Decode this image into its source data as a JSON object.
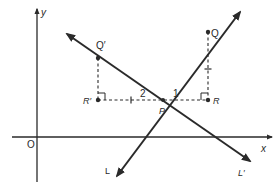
{
  "diagram": {
    "type": "coordinate-geometry",
    "colors": {
      "ink": "#2a2a2a",
      "background": "#ffffff"
    },
    "axes": {
      "x_label": "x",
      "y_label": "y",
      "origin_label": "O"
    },
    "points": {
      "P": {
        "label": "P"
      },
      "Q": {
        "label": "Q"
      },
      "Q_prime": {
        "label": "Q′"
      },
      "R": {
        "label": "R"
      },
      "R_prime": {
        "label": "R′"
      }
    },
    "lines": {
      "L": {
        "label": "L"
      },
      "L_prime": {
        "label": "L′"
      }
    },
    "angle_labels": {
      "angle1": "1",
      "angle2": "2"
    }
  }
}
